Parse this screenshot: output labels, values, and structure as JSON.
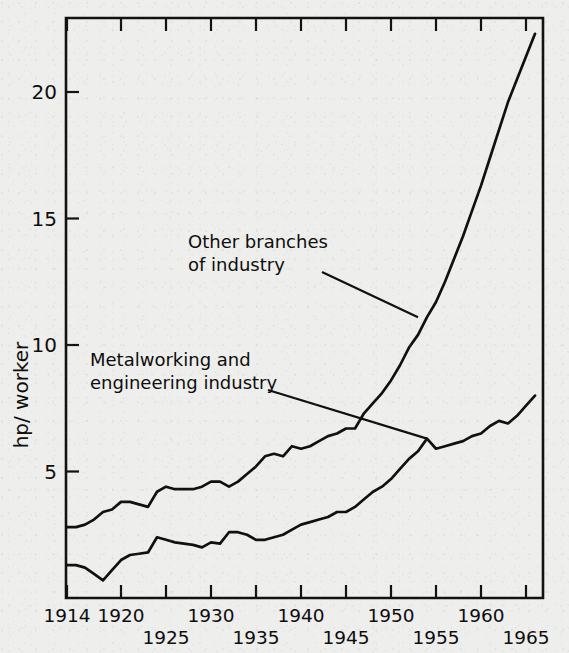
{
  "chart_data": {
    "type": "line",
    "title": "",
    "xlabel": "",
    "ylabel": "hp/ worker",
    "xlim": [
      1913.5,
      1967.0
    ],
    "ylim": [
      0,
      23.0
    ],
    "grid": false,
    "legend_position": "inline-annotations",
    "xticks": [
      1914,
      1920,
      1925,
      1930,
      1935,
      1940,
      1945,
      1950,
      1955,
      1960,
      1965
    ],
    "xtick_labels": [
      "1914",
      "1920",
      "1925",
      "1930",
      "1935",
      "1940",
      "1945",
      "1950",
      "1955",
      "1960",
      "1965"
    ],
    "xtick_label_rows": [
      0,
      0,
      1,
      0,
      1,
      0,
      1,
      0,
      1,
      0,
      1
    ],
    "yticks": [
      5,
      10,
      15,
      20
    ],
    "ytick_labels": [
      "5",
      "10",
      "15",
      "20"
    ],
    "annotations": [
      {
        "text_line1": "Other branches",
        "text_line2": "of industry",
        "target_year": 1953,
        "target_value": 11.1
      },
      {
        "text_line1": "Metalworking and",
        "text_line2": "engineering industry",
        "target_year": 1954,
        "target_value": 6.3
      }
    ],
    "series": [
      {
        "name": "Other branches of industry",
        "x": [
          1914,
          1915,
          1916,
          1917,
          1918,
          1919,
          1920,
          1921,
          1922,
          1923,
          1924,
          1925,
          1926,
          1927,
          1928,
          1929,
          1930,
          1931,
          1932,
          1933,
          1934,
          1935,
          1936,
          1937,
          1938,
          1939,
          1940,
          1941,
          1942,
          1943,
          1944,
          1945,
          1946,
          1947,
          1948,
          1949,
          1950,
          1951,
          1952,
          1953,
          1954,
          1955,
          1956,
          1957,
          1958,
          1959,
          1960,
          1961,
          1962,
          1963,
          1964,
          1965,
          1966
        ],
        "values": [
          2.8,
          2.8,
          2.9,
          3.1,
          3.4,
          3.5,
          3.8,
          3.8,
          3.7,
          3.6,
          4.2,
          4.4,
          4.3,
          4.3,
          4.3,
          4.4,
          4.6,
          4.6,
          4.4,
          4.6,
          4.9,
          5.2,
          5.6,
          5.7,
          5.6,
          6.0,
          5.9,
          6.0,
          6.2,
          6.4,
          6.5,
          6.7,
          6.7,
          7.3,
          7.7,
          8.1,
          8.6,
          9.2,
          9.9,
          10.4,
          11.1,
          11.7,
          12.5,
          13.4,
          14.3,
          15.3,
          16.3,
          17.4,
          18.5,
          19.6,
          20.5,
          21.4,
          22.3
        ],
        "color": "#101010"
      },
      {
        "name": "Metalworking and engineering industry",
        "x": [
          1914,
          1915,
          1916,
          1917,
          1918,
          1919,
          1920,
          1921,
          1922,
          1923,
          1924,
          1925,
          1926,
          1927,
          1928,
          1929,
          1930,
          1931,
          1932,
          1933,
          1934,
          1935,
          1936,
          1937,
          1938,
          1939,
          1940,
          1941,
          1942,
          1943,
          1944,
          1945,
          1946,
          1947,
          1948,
          1949,
          1950,
          1951,
          1952,
          1953,
          1954,
          1955,
          1956,
          1957,
          1958,
          1959,
          1960,
          1961,
          1962,
          1963,
          1964,
          1965,
          1966
        ],
        "values": [
          1.3,
          1.3,
          1.2,
          0.95,
          0.7,
          1.1,
          1.5,
          1.7,
          1.75,
          1.8,
          2.4,
          2.3,
          2.2,
          2.15,
          2.1,
          2.0,
          2.2,
          2.15,
          2.6,
          2.6,
          2.5,
          2.3,
          2.3,
          2.4,
          2.5,
          2.7,
          2.9,
          3.0,
          3.1,
          3.2,
          3.4,
          3.4,
          3.6,
          3.9,
          4.2,
          4.4,
          4.7,
          5.1,
          5.5,
          5.8,
          6.3,
          5.9,
          6.0,
          6.1,
          6.2,
          6.4,
          6.5,
          6.8,
          7.0,
          6.9,
          7.2,
          7.6,
          8.0
        ],
        "color": "#101010"
      }
    ]
  },
  "plot": {
    "frame": {
      "left": 66,
      "right": 543,
      "top": 18,
      "bottom": 598
    },
    "x_of_1914": 67,
    "px_per_year": 9.0,
    "y_of_zero": 598,
    "px_per_unit": 25.3
  },
  "labels": {
    "y_axis_title": "hp/ worker"
  }
}
